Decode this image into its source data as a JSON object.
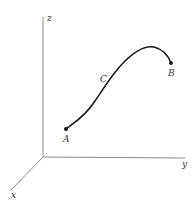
{
  "diagram": {
    "type": "3d-space-curve",
    "colors": {
      "axis": "#8a8a8a",
      "curve": "#1a1a1a",
      "label": "#333333",
      "background": "#ffffff"
    },
    "axes": {
      "origin": [
        43,
        157
      ],
      "z": {
        "label": "z",
        "end": [
          43,
          17
        ],
        "label_pos": [
          47,
          21
        ]
      },
      "y": {
        "label": "y",
        "end": [
          185,
          158
        ],
        "label_pos": [
          182,
          167
        ]
      },
      "x": {
        "label": "x",
        "end": [
          11,
          190
        ],
        "label_pos": [
          11,
          198
        ]
      }
    },
    "curve": {
      "path": "M66,129 C72,124 84,118 95,101 C104,88 112,74 124,62 C134,52 144,45 154,47 C162,49 168,55 171,63"
    },
    "points": [
      {
        "name": "A",
        "pos": [
          66,
          129
        ],
        "label_pos": [
          63,
          142
        ]
      },
      {
        "name": "B",
        "pos": [
          171,
          63
        ],
        "label_pos": [
          168,
          76
        ]
      }
    ],
    "labels": [
      {
        "name": "C",
        "label_pos": [
          100,
          82
        ]
      }
    ]
  }
}
